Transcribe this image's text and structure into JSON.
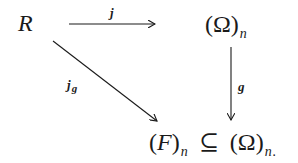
{
  "diagram": {
    "type": "commutative-diagram",
    "nodes": {
      "R": {
        "base": "R",
        "sub": ""
      },
      "omega_n": {
        "open": "(",
        "base": "Ω",
        "close": ")",
        "sub": "n"
      },
      "bottom": {
        "left": {
          "open": "(",
          "base": "F",
          "close": ")",
          "sub": "n"
        },
        "relation": "⊆",
        "right": {
          "open": "(",
          "base": "Ω",
          "close": ")",
          "sub": "n"
        },
        "trailing": "."
      }
    },
    "arrows": [
      {
        "from": "R",
        "to": "omega_n",
        "label": "j",
        "label_sub": ""
      },
      {
        "from": "omega_n",
        "to": "bottom",
        "label": "g",
        "label_sub": ""
      },
      {
        "from": "R",
        "to": "bottom",
        "label": "j",
        "label_sub": "g"
      }
    ],
    "colors": {
      "ink": "#1a1a1a",
      "background": "#ffffff"
    }
  }
}
